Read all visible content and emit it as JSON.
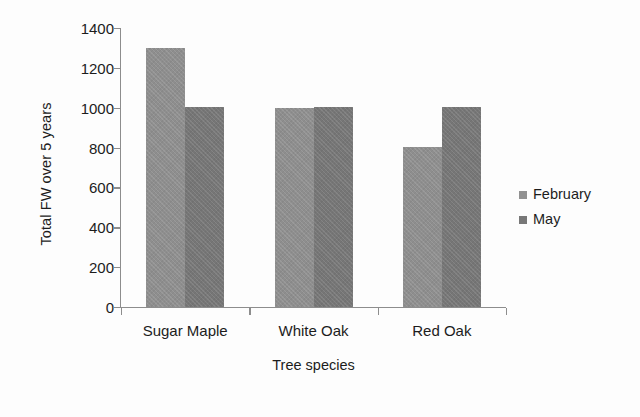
{
  "chart_data": {
    "type": "bar",
    "title": "",
    "subtitle": "",
    "categories": [
      "Sugar Maple",
      "White Oak",
      "Red Oak"
    ],
    "series": [
      {
        "name": "February",
        "values": [
          1300,
          1000,
          805
        ],
        "color": "#8e8e8e"
      },
      {
        "name": "May",
        "values": [
          1005,
          1005,
          1005
        ],
        "color": "#767676"
      }
    ],
    "xlabel": "Tree species",
    "ylabel": "Total FW over 5 years",
    "ylim": [
      0,
      1400
    ],
    "yticks": [
      0,
      200,
      400,
      600,
      800,
      1000,
      1200,
      1400
    ],
    "ytick_labels": [
      "0",
      "200",
      "400",
      "600",
      "800",
      "1000",
      "1200",
      "1400"
    ],
    "grid": false,
    "legend_position": "right",
    "bar_gap": 0,
    "group_gap": true,
    "plot_border": false
  },
  "legend": {
    "items": [
      {
        "label": "February",
        "marker": "square-swatch"
      },
      {
        "label": "May",
        "marker": "square-swatch"
      }
    ]
  },
  "axes": {
    "x_title": "Tree species",
    "y_title": "Total FW over 5 years"
  }
}
